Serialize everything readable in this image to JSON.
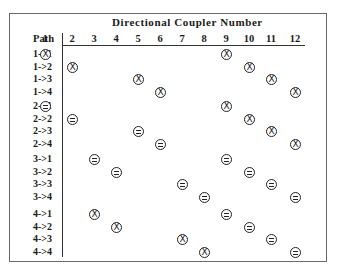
{
  "table": {
    "title": "Directional Coupler Number",
    "path_header": "Path",
    "columns": [
      "1",
      "2",
      "3",
      "4",
      "5",
      "6",
      "7",
      "8",
      "9",
      "10",
      "11",
      "12"
    ],
    "legend": {
      "X": "crossed state (circled X)",
      "=": "bar state (circled =)"
    },
    "groups": [
      {
        "rows": [
          {
            "label": "1->1",
            "cells": [
              {
                "col": 1,
                "sym": "X"
              },
              {
                "col": 9,
                "sym": "X"
              }
            ]
          },
          {
            "label": "1->2",
            "cells": [
              {
                "col": 2,
                "sym": "X"
              },
              {
                "col": 10,
                "sym": "X"
              }
            ]
          },
          {
            "label": "1->3",
            "cells": [
              {
                "col": 5,
                "sym": "X"
              },
              {
                "col": 11,
                "sym": "X"
              }
            ]
          },
          {
            "label": "1->4",
            "cells": [
              {
                "col": 6,
                "sym": "X"
              },
              {
                "col": 12,
                "sym": "X"
              }
            ]
          }
        ]
      },
      {
        "rows": [
          {
            "label": "2->1",
            "cells": [
              {
                "col": 1,
                "sym": "="
              },
              {
                "col": 9,
                "sym": "X"
              }
            ]
          },
          {
            "label": "2->2",
            "cells": [
              {
                "col": 2,
                "sym": "="
              },
              {
                "col": 10,
                "sym": "X"
              }
            ]
          },
          {
            "label": "2->3",
            "cells": [
              {
                "col": 5,
                "sym": "="
              },
              {
                "col": 11,
                "sym": "X"
              }
            ]
          },
          {
            "label": "2->4",
            "cells": [
              {
                "col": 6,
                "sym": "="
              },
              {
                "col": 12,
                "sym": "X"
              }
            ]
          }
        ]
      },
      {
        "rows": [
          {
            "label": "3->1",
            "cells": [
              {
                "col": 3,
                "sym": "="
              },
              {
                "col": 9,
                "sym": "="
              }
            ]
          },
          {
            "label": "3->2",
            "cells": [
              {
                "col": 4,
                "sym": "="
              },
              {
                "col": 10,
                "sym": "="
              }
            ]
          },
          {
            "label": "3->3",
            "cells": [
              {
                "col": 7,
                "sym": "="
              },
              {
                "col": 11,
                "sym": "="
              }
            ]
          },
          {
            "label": "3->4",
            "cells": [
              {
                "col": 8,
                "sym": "="
              },
              {
                "col": 12,
                "sym": "="
              }
            ]
          }
        ]
      },
      {
        "rows": [
          {
            "label": "4->1",
            "cells": [
              {
                "col": 3,
                "sym": "X"
              },
              {
                "col": 9,
                "sym": "="
              }
            ]
          },
          {
            "label": "4->2",
            "cells": [
              {
                "col": 4,
                "sym": "X"
              },
              {
                "col": 10,
                "sym": "="
              }
            ]
          },
          {
            "label": "4->3",
            "cells": [
              {
                "col": 7,
                "sym": "X"
              },
              {
                "col": 11,
                "sym": "="
              }
            ]
          },
          {
            "label": "4->4",
            "cells": [
              {
                "col": 8,
                "sym": "X"
              },
              {
                "col": 12,
                "sym": "="
              }
            ]
          }
        ]
      }
    ]
  }
}
